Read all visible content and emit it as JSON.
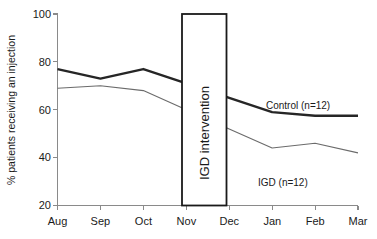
{
  "chart_data": {
    "type": "line",
    "title": "",
    "xlabel": "",
    "ylabel": "% patients receiving an injection",
    "categories": [
      "Aug",
      "Sep",
      "Oct",
      "Nov",
      "Dec",
      "Jan",
      "Feb",
      "Mar"
    ],
    "ylim": [
      20,
      100
    ],
    "yticks": [
      20,
      40,
      60,
      80,
      100
    ],
    "ytick_labels": [
      "20",
      "40",
      "60",
      "80",
      "100"
    ],
    "grid": false,
    "legend_position": "inline-annotation",
    "series": [
      {
        "name": "Control (n=12)",
        "values": [
          77,
          73,
          77,
          71,
          65,
          59,
          57.5,
          57.5
        ],
        "color": "#262626",
        "line_width": 2.4,
        "label": "Control (n=12)"
      },
      {
        "name": "IGD (n=12)",
        "values": [
          69,
          70,
          68,
          60,
          52,
          44,
          46,
          42
        ],
        "color": "#6b6b6b",
        "line_width": 1.1,
        "label": "IGD (n=12)"
      }
    ],
    "annotations": [
      {
        "name": "intervention-box",
        "text": "IGD intervention",
        "x_start": "Nov",
        "x_end": "Dec",
        "y_bottom": 20,
        "y_top": 100,
        "orientation": "vertical"
      }
    ]
  },
  "labels": {
    "y_axis_title": "% patients receiving an injection",
    "y_ticks": [
      "100",
      "80",
      "60",
      "40",
      "20"
    ],
    "x_ticks": [
      "Aug",
      "Sep",
      "Oct",
      "Nov",
      "Dec",
      "Jan",
      "Feb",
      "Mar"
    ],
    "control_series": "Control (n=12)",
    "igd_series": "IGD (n=12)",
    "intervention_box": "IGD intervention"
  },
  "colors": {
    "control_line": "#262626",
    "igd_line": "#6b6b6b",
    "axis": "#8a8a8a",
    "box_border": "#1a1a1a",
    "text": "#1a1a1a",
    "background": "#ffffff"
  }
}
